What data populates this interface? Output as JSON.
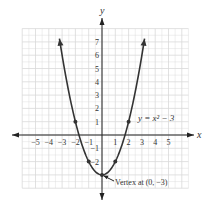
{
  "chart_data": {
    "type": "line",
    "title": "",
    "equation_label": "y = x² − 3",
    "xlabel": "x",
    "ylabel": "y",
    "xlim": [
      -6,
      6.5
    ],
    "ylim": [
      -4,
      8
    ],
    "grid": true,
    "x_ticks": [
      -5,
      -4,
      -3,
      -2,
      -1,
      1,
      2,
      3,
      4,
      5
    ],
    "x_tick_labels": [
      "−5",
      "−4",
      "−3",
      "−2",
      "−1",
      "1",
      "2",
      "3",
      "4",
      "5"
    ],
    "y_ticks": [
      7,
      6,
      5,
      4,
      3,
      2,
      1,
      -1,
      -2
    ],
    "y_tick_labels": [
      "7",
      "6",
      "5",
      "4",
      "3",
      "2",
      "1",
      "−1",
      "−2"
    ],
    "series": [
      {
        "name": "y = x^2 - 3",
        "function": "x^2 - 3",
        "x": [
          -3.2,
          -3,
          -2,
          -1,
          0,
          1,
          2,
          3,
          3.2
        ],
        "y": [
          7.24,
          6,
          1,
          -2,
          -3,
          -2,
          1,
          6,
          7.24
        ],
        "marked_points": [
          [
            -2,
            1
          ],
          [
            -1,
            -2
          ],
          [
            0,
            -3
          ],
          [
            1,
            -2
          ],
          [
            2,
            1
          ]
        ]
      }
    ],
    "annotations": [
      {
        "text": "Vertex at (0, −3)",
        "point": [
          0,
          -3
        ]
      }
    ]
  },
  "colors": {
    "curve": "#333333",
    "axis": "#222222",
    "grid": "#d9d9d9",
    "text": "#333333"
  }
}
